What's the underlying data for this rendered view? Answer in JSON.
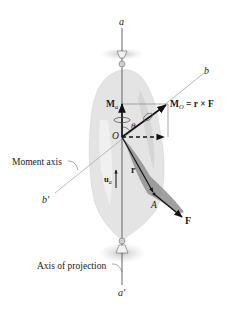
{
  "figure": {
    "axis_top_label": "a",
    "axis_bottom_label": "a'",
    "moment_axis_end_label": "b",
    "moment_axis_start_label": "b'",
    "moment_axis_caption": "Moment axis",
    "projection_axis_caption": "Axis of projection",
    "Ma_label_main": "M",
    "Ma_label_sub": "a",
    "MO_label_main": "M",
    "MO_label_sub": "O",
    "MO_label_eq": " = r × F",
    "theta_label": "θ",
    "origin_label": "O",
    "r_label": "r",
    "ua_label_main": "u",
    "ua_label_sub": "a",
    "point_label": "A",
    "force_label": "F"
  },
  "colors": {
    "body_fill": "#e6e6e6",
    "shadow_fill": "#b8b8b8",
    "line": "#222222",
    "thin_line": "#9a9a9a",
    "wrench_fill": "#8c8c8c"
  }
}
